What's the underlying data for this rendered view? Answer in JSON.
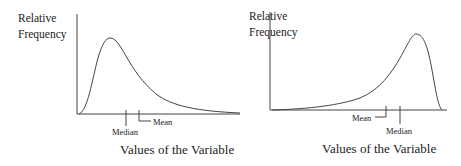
{
  "diagrams": [
    {
      "id": "right-skewed",
      "y_axis_label_line1": "Relative",
      "y_axis_label_line2": "Frequency",
      "x_axis_label": "Values of the Variable",
      "markers": {
        "first": "Median",
        "second": "Mean"
      }
    },
    {
      "id": "left-skewed",
      "y_axis_label_line1": "Relative",
      "y_axis_label_line2": "Frequency",
      "x_axis_label": "Values of the Variable",
      "markers": {
        "first": "Mean",
        "second": "Median"
      }
    }
  ],
  "colors": {
    "line": "#444444",
    "text": "#222222",
    "background": "#ffffff"
  }
}
